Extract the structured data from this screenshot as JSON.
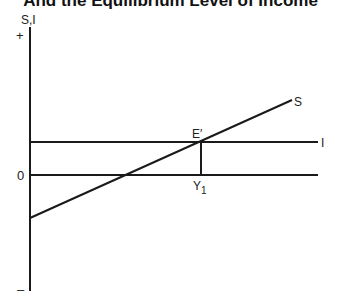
{
  "title": "And the Equilibrium Level of Income",
  "axis": {
    "y_label": "S,I",
    "plus": "+",
    "minus": "–",
    "zero": "0"
  },
  "curves": {
    "saving_label": "S",
    "investment_label": "I"
  },
  "points": {
    "equilibrium_label": "E′",
    "income_label": "Y",
    "income_subscript": "1"
  },
  "colors": {
    "line": "#1a1a1a",
    "background": "#ffffff"
  }
}
